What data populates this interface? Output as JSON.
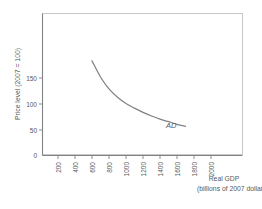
{
  "chart_data": {
    "type": "line",
    "title": "",
    "subtitle": "",
    "xlabel": "Real GDP",
    "xlabel_sub": "(billions of 2007 dollars)",
    "ylabel": "Price level (2007 = 100)",
    "xlim": [
      0,
      2100
    ],
    "ylim": [
      0,
      190
    ],
    "grid": false,
    "legend": "none",
    "xticks": [
      200,
      400,
      600,
      800,
      1000,
      1200,
      1400,
      1600,
      1800,
      2000
    ],
    "xtick_labels": [
      "200",
      "400",
      "600",
      "800",
      "1000",
      "1200",
      "1400",
      "1600",
      "1800",
      "2000"
    ],
    "xtick_rotation": 90,
    "yticks": [
      0,
      50,
      100,
      150
    ],
    "ytick_labels": [
      "0",
      "50",
      "100",
      "150"
    ],
    "series": [
      {
        "name": "AD",
        "label": "AD",
        "annotation": "AD",
        "x": [
          600,
          700,
          800,
          900,
          1000,
          1100,
          1200,
          1300,
          1400,
          1500,
          1600,
          1700
        ],
        "y": [
          183,
          152,
          129,
          113,
          101,
          92,
          84,
          77,
          71,
          66,
          61,
          57
        ]
      }
    ],
    "annotations": [
      {
        "text": "AD",
        "x": 1790,
        "y": 52,
        "style": "italic"
      }
    ],
    "colors": {
      "curve": "#808285",
      "axis": "#808285",
      "frame": "#c7c8ca",
      "text": "#58595b",
      "background": "#ffffff"
    }
  },
  "figure": {
    "name": "aggregate-demand-curve",
    "background": "#ffffff"
  }
}
